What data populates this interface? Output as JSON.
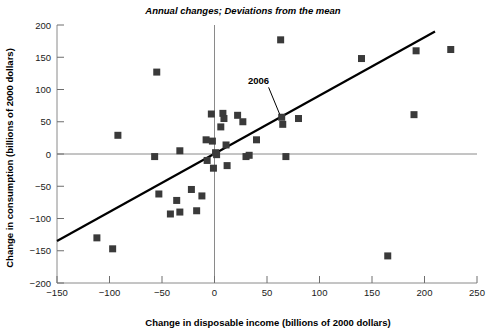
{
  "chart_data": {
    "type": "scatter",
    "title": "Annual changes; Deviations from the mean",
    "xlabel": "Change in disposable income (billions of 2000 dollars)",
    "ylabel": "Change in consumption (billions of 2000 dollars)",
    "xlim": [
      -150,
      250
    ],
    "ylim": [
      -200,
      200
    ],
    "xticks": [
      -150,
      -100,
      -50,
      0,
      50,
      100,
      150,
      200,
      250
    ],
    "xtick_labels": [
      "−150",
      "−100",
      "−50",
      "0",
      "50",
      "100",
      "150",
      "200",
      "250"
    ],
    "yticks": [
      -200,
      -150,
      -100,
      -50,
      0,
      50,
      100,
      150,
      200
    ],
    "ytick_labels": [
      "−200",
      "−150",
      "−100",
      "−50",
      "0",
      "50",
      "100",
      "150",
      "200"
    ],
    "grid": false,
    "legend": null,
    "zero_lines": {
      "x": 0,
      "y": 0
    },
    "marker_style": {
      "shape": "square",
      "size": 7,
      "color": "#3a3a3a"
    },
    "points": [
      {
        "x": -112,
        "y": -130
      },
      {
        "x": -97,
        "y": -147
      },
      {
        "x": -92,
        "y": 29
      },
      {
        "x": -55,
        "y": 127
      },
      {
        "x": -57,
        "y": -4
      },
      {
        "x": -53,
        "y": -62
      },
      {
        "x": -42,
        "y": -93
      },
      {
        "x": -33,
        "y": -90
      },
      {
        "x": -36,
        "y": -72
      },
      {
        "x": -33,
        "y": 5
      },
      {
        "x": -22,
        "y": -55
      },
      {
        "x": -17,
        "y": -88
      },
      {
        "x": -12,
        "y": -65
      },
      {
        "x": -8,
        "y": 22
      },
      {
        "x": -7,
        "y": -10
      },
      {
        "x": -3,
        "y": 62
      },
      {
        "x": -2,
        "y": 20
      },
      {
        "x": -1,
        "y": -22
      },
      {
        "x": 1,
        "y": 2
      },
      {
        "x": 2,
        "y": -1
      },
      {
        "x": 6,
        "y": 42
      },
      {
        "x": 8,
        "y": 63
      },
      {
        "x": 9,
        "y": 55
      },
      {
        "x": 11,
        "y": 14
      },
      {
        "x": 12,
        "y": -18
      },
      {
        "x": 22,
        "y": 60
      },
      {
        "x": 27,
        "y": 50
      },
      {
        "x": 30,
        "y": -4
      },
      {
        "x": 33,
        "y": -2
      },
      {
        "x": 40,
        "y": 22
      },
      {
        "x": 63,
        "y": 177
      },
      {
        "x": 64,
        "y": 57
      },
      {
        "x": 65,
        "y": 46
      },
      {
        "x": 68,
        "y": -4
      },
      {
        "x": 80,
        "y": 55
      },
      {
        "x": 140,
        "y": 148
      },
      {
        "x": 165,
        "y": -158
      },
      {
        "x": 190,
        "y": 61
      },
      {
        "x": 192,
        "y": 160
      },
      {
        "x": 225,
        "y": 162
      }
    ],
    "trend_line": {
      "x_start": -150,
      "y_start": -135,
      "x_end": 210,
      "y_end": 190
    },
    "annotations": [
      {
        "label": "2006",
        "label_x": 42,
        "label_y": 108,
        "point_x": 64,
        "point_y": 57
      }
    ]
  }
}
